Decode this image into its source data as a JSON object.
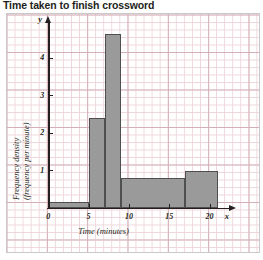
{
  "title": "Time taken to finish crossword",
  "axes": {
    "x_letter": "x",
    "y_letter": "y",
    "x_title": "Time (minutes)",
    "y_title_line1": "Frequency density",
    "y_title_line2": "(frequency per minute)"
  },
  "chart_data": {
    "type": "bar",
    "subtype": "histogram",
    "title": "Time taken to finish crossword",
    "xlabel": "Time (minutes)",
    "ylabel": "Frequency density (frequency per minute)",
    "xlim": [
      0,
      23
    ],
    "ylim": [
      0,
      5.1
    ],
    "xticks": [
      0,
      5,
      10,
      15,
      20
    ],
    "xtick_labels": [
      "0",
      "5",
      "10",
      "15",
      "20"
    ],
    "yticks": [
      1,
      2,
      3,
      4
    ],
    "ytick_labels": [
      "1",
      "2",
      "3",
      "4"
    ],
    "grid": true,
    "grid_minor_step_x": 1,
    "grid_minor_step_y": 0.2,
    "grid_major_step_x": 5,
    "grid_major_step_y": 1,
    "legend": null,
    "bars": [
      {
        "label": "0-5",
        "bin_start": 0,
        "bin_end": 5,
        "value": 0.17,
        "frequency": 0.85
      },
      {
        "label": "5-7",
        "bin_start": 5,
        "bin_end": 7,
        "value": 2.4,
        "frequency": 4.8
      },
      {
        "label": "7-9",
        "bin_start": 7,
        "bin_end": 9,
        "value": 4.65,
        "frequency": 9.3
      },
      {
        "label": "9-17",
        "bin_start": 9,
        "bin_end": 17,
        "value": 0.8,
        "frequency": 6.4
      },
      {
        "label": "17-21",
        "bin_start": 17,
        "bin_end": 21,
        "value": 1.0,
        "frequency": 4.0
      }
    ],
    "bar_fill_color": "#9a9a9a",
    "bar_edge_color": "#4f4f4f",
    "axis_color": "#231f20",
    "grid_color": "#e8c9cf"
  }
}
